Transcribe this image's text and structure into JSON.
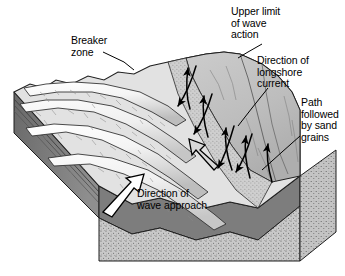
{
  "figure": {
    "type": "block-diagram",
    "width": 345,
    "height": 276,
    "background_color": "#ffffff"
  },
  "labels": {
    "breaker_zone": "Breaker\nzone",
    "upper_limit": "Upper limit\nof wave\naction",
    "longshore_current": "Direction of\nlongshore\ncurrent",
    "sand_path": "Path\nfollowed\nby sand\ngrains",
    "wave_approach": "Direction of\nwave approach"
  },
  "colors": {
    "ink": "#000000",
    "wave_crest": "#f2f2f2",
    "wave_trough": "#d0d0d0",
    "water_surface": "#e8e8e8",
    "beach_upper": "#c2c2c2",
    "beach_mid": "#b4b4b4",
    "swash_stipple": "#cfcfcf",
    "block_side_dark": "#6e6e6e",
    "block_side_mid": "#8a8a8a",
    "block_front_dark": "#7a7a7a",
    "sand_body": "#c9c9c9",
    "outline": "#1a1a1a"
  },
  "annotations": {
    "arrow_wave_approach": "solid outlined arrow pointing up-right across wave crests",
    "arrow_longshore_current": "large outlined arrow pointing up-left along the shoreline",
    "arrows_sand_path": "zigzag solid arrows showing sand grains moving up the swash and back down"
  },
  "leaders": {
    "breaker_zone": "line from label down-right to wave crest in breaker zone",
    "upper_limit": "line from label down-left to the upper beach crest",
    "longshore_current": "line from label down-left to the shoreline",
    "sand_path": "line from label down-left to the zigzag arrow path"
  }
}
